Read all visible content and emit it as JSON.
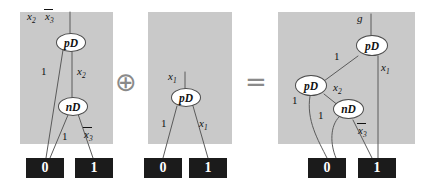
{
  "figure": {
    "kind": "bdd-graph-equation",
    "operators": {
      "plus": "⊕",
      "equals": "="
    },
    "colors": {
      "panel_bg": "#c9c9c9",
      "page_bg": "#ffffff",
      "node_fill": "#ffffff",
      "node_stroke": "#4a4a4a",
      "terminal_fill": "#1b1b1b",
      "terminal_text": "#ffffff",
      "edge": "#5a5a5a",
      "operator": "#8a8a8a"
    }
  },
  "panels": [
    {
      "id": "left-operand",
      "root_labels": [
        "x",
        "x"
      ],
      "root_label_0": {
        "base": "x",
        "sub": "2",
        "overbar": false
      },
      "root_label_1": {
        "base": "x",
        "sub": "3",
        "overbar": true
      },
      "nodes": [
        {
          "id": "p1-pd",
          "label": "pD"
        },
        {
          "id": "p1-nd",
          "label": "nD"
        }
      ],
      "edge_labels": [
        {
          "id": "p1-e1",
          "text": "1",
          "overbar": false
        },
        {
          "id": "p1-e2",
          "base": "x",
          "sub": "2",
          "overbar": false
        },
        {
          "id": "p1-e3",
          "text": "1",
          "overbar": false
        },
        {
          "id": "p1-e4",
          "base": "x",
          "sub": "3",
          "overbar": true
        }
      ],
      "terminals": [
        {
          "id": "p1-t0",
          "label": "0"
        },
        {
          "id": "p1-t1",
          "label": "1"
        }
      ]
    },
    {
      "id": "right-operand",
      "root_label": {
        "base": "x",
        "sub": "1",
        "overbar": false
      },
      "nodes": [
        {
          "id": "p2-pd",
          "label": "pD"
        }
      ],
      "edge_labels": [
        {
          "id": "p2-e1",
          "text": "1",
          "overbar": false
        },
        {
          "id": "p2-e2",
          "base": "x",
          "sub": "1",
          "overbar": false
        }
      ],
      "terminals": [
        {
          "id": "p2-t0",
          "label": "0"
        },
        {
          "id": "p2-t1",
          "label": "1"
        }
      ]
    },
    {
      "id": "result",
      "root_label": {
        "base": "g",
        "sub": "",
        "overbar": false
      },
      "nodes": [
        {
          "id": "p3-pd-top",
          "label": "pD"
        },
        {
          "id": "p3-pd-mid",
          "label": "pD"
        },
        {
          "id": "p3-nd",
          "label": "nD"
        }
      ],
      "edge_labels": [
        {
          "id": "p3-e1",
          "text": "1",
          "overbar": false
        },
        {
          "id": "p3-e2",
          "base": "x",
          "sub": "1",
          "overbar": false
        },
        {
          "id": "p3-e3",
          "text": "1",
          "overbar": false
        },
        {
          "id": "p3-e4",
          "base": "x",
          "sub": "2",
          "overbar": false
        },
        {
          "id": "p3-e5",
          "text": "1",
          "overbar": false
        },
        {
          "id": "p3-e6",
          "base": "x",
          "sub": "3",
          "overbar": true
        }
      ],
      "terminals": [
        {
          "id": "p3-t0",
          "label": "0"
        },
        {
          "id": "p3-t1",
          "label": "1"
        }
      ]
    }
  ]
}
